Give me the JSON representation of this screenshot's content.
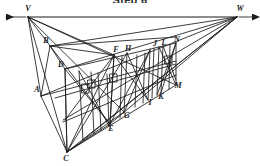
{
  "title": "Step 6",
  "figure": {
    "type": "two-point-perspective-construction",
    "stroke_color": "#1a1a1a",
    "background_color": "#ffffff",
    "horizon_line": {
      "y": 17,
      "x_start": 2,
      "x_end": 256,
      "left_arrow": true,
      "right_arrow": true
    },
    "vanishing_points": [
      {
        "id": "V",
        "label": "V",
        "x": 28,
        "y": 17
      },
      {
        "id": "W",
        "label": "W",
        "x": 237,
        "y": 17
      }
    ],
    "points": [
      {
        "id": "V",
        "label": "V",
        "x": 28,
        "y": 17,
        "lx": 28,
        "ly": 9
      },
      {
        "id": "W",
        "label": "W",
        "x": 237,
        "y": 17,
        "lx": 240,
        "ly": 9
      },
      {
        "id": "A",
        "label": "A",
        "x": 41,
        "y": 96,
        "lx": 37,
        "ly": 90
      },
      {
        "id": "B",
        "label": "B",
        "x": 50,
        "y": 46,
        "lx": 46,
        "ly": 41
      },
      {
        "id": "C",
        "label": "C",
        "x": 67,
        "y": 152,
        "lx": 66,
        "ly": 159
      },
      {
        "id": "D",
        "label": "D",
        "x": 65,
        "y": 69,
        "lx": 61,
        "ly": 65
      },
      {
        "id": "E",
        "label": "E",
        "x": 110,
        "y": 124,
        "lx": 111,
        "ly": 129
      },
      {
        "id": "F",
        "label": "F",
        "x": 114,
        "y": 55,
        "lx": 116,
        "ly": 50
      },
      {
        "id": "G",
        "label": "G",
        "x": 124,
        "y": 112,
        "lx": 127,
        "ly": 116
      },
      {
        "id": "H",
        "label": "H",
        "x": 127,
        "y": 53,
        "lx": 128,
        "ly": 49
      },
      {
        "id": "I",
        "label": "I",
        "x": 150,
        "y": 101,
        "lx": 150,
        "ly": 103
      },
      {
        "id": "J",
        "label": "J",
        "x": 154,
        "y": 48,
        "lx": 155,
        "ly": 44
      },
      {
        "id": "K",
        "label": "K",
        "x": 159,
        "y": 95,
        "lx": 161,
        "ly": 97
      },
      {
        "id": "L",
        "label": "L",
        "x": 163,
        "y": 46,
        "lx": 164,
        "ly": 43
      },
      {
        "id": "M",
        "label": "M",
        "x": 176,
        "y": 85,
        "lx": 178,
        "ly": 86
      },
      {
        "id": "N",
        "label": "N",
        "x": 176,
        "y": 43,
        "lx": 177,
        "ly": 40
      }
    ]
  }
}
